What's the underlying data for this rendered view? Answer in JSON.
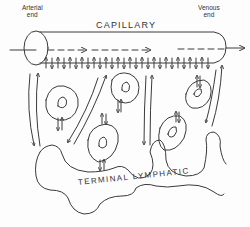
{
  "diagram": {
    "type": "physiology-schematic",
    "labels": {
      "arterial_end": "Arterial\nend",
      "arterial_line1": "Arterial",
      "arterial_line2": "end",
      "venous_line1": "Venous",
      "venous_line2": "end",
      "capillary": "CAPILLARY",
      "terminal_lymphatic": "TERMINAL  LYMPHATIC"
    },
    "elements": {
      "capillary_tube": "horizontal cylinder from arterial end (left) to venous end (right)",
      "flow_arrow": "dashed arrow through capillary, left to right",
      "filtration_arrows": "row of small up/down arrows along capillary bottom wall",
      "cells": 5,
      "interstitial_flow_arrows": "long paired arrows between capillary and lymphatic",
      "lymphatic": "irregular wavy outline below cells"
    },
    "colors": {
      "ink": "#3a3a3a",
      "background": "#fdfdfd"
    }
  }
}
